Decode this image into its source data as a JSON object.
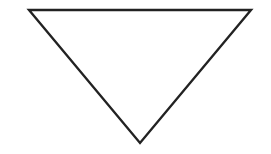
{
  "diagram": {
    "shape": "inverted-triangle",
    "stroke_color": "#222222",
    "fill_color": "#ffffff",
    "background_color": "#ffffff"
  }
}
